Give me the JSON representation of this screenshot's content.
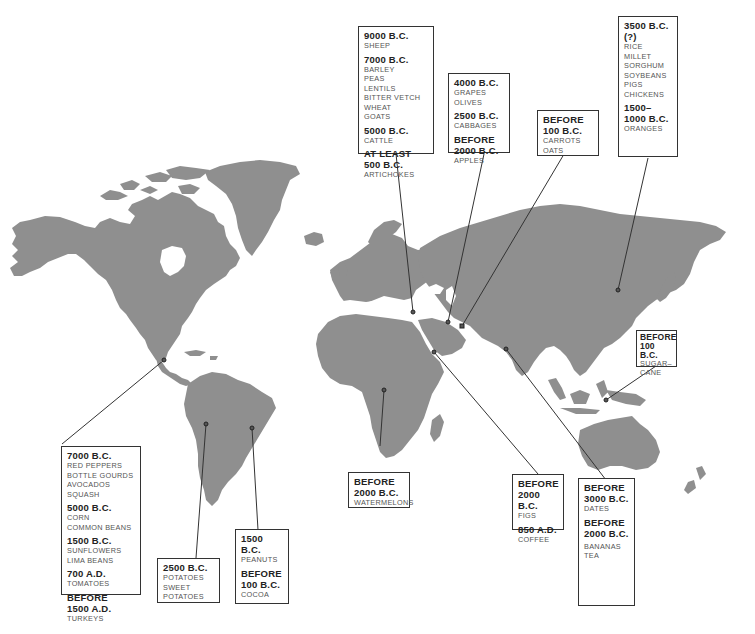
{
  "map": {
    "title": "",
    "land_color": "#8f8f8f",
    "background_color": "#ffffff",
    "callouts": [
      {
        "id": "fertile-crescent-1",
        "region": "Anatolia / Near East",
        "groups": [
          {
            "date": "9000 B.C.",
            "items": [
              "SHEEP"
            ]
          },
          {
            "date": "7000 B.C.",
            "items": [
              "BARLEY",
              "PEAS",
              "LENTILS",
              "BITTER VETCH",
              "WHEAT",
              "GOATS"
            ]
          },
          {
            "date": "5000 B.C.",
            "items": [
              "CATTLE"
            ]
          },
          {
            "date": "AT LEAST 500 B.C.",
            "date_lines": [
              "AT LEAST",
              "500 B.C."
            ],
            "items": [
              "ARTICHOKES"
            ]
          }
        ]
      },
      {
        "id": "near-east-2",
        "region": "Caucasus / Mesopotamia",
        "groups": [
          {
            "date": "4000 B.C.",
            "items": [
              "GRAPES",
              "OLIVES"
            ]
          },
          {
            "date": "2500 B.C.",
            "items": [
              "CABBAGES"
            ]
          },
          {
            "date": "BEFORE 2000 B.C.",
            "date_lines": [
              "BEFORE",
              "2000 B.C."
            ],
            "items": [
              "APPLES"
            ]
          }
        ]
      },
      {
        "id": "central-asia",
        "region": "Central Asia",
        "groups": [
          {
            "date": "BEFORE 100 B.C.",
            "date_lines": [
              "BEFORE",
              "100 B.C."
            ],
            "items": [
              "CARROTS",
              "OATS"
            ]
          }
        ]
      },
      {
        "id": "china",
        "region": "China",
        "groups": [
          {
            "date": "3500 B.C. (?)",
            "items": [
              "RICE",
              "MILLET",
              "SORGHUM",
              "SOYBEANS",
              "PIGS",
              "CHICKENS"
            ]
          },
          {
            "date": "1500–1000 B.C.",
            "date_lines": [
              "1500–",
              "1000 B.C."
            ],
            "items": [
              "ORANGES"
            ]
          }
        ]
      },
      {
        "id": "new-guinea",
        "region": "Indonesia / New Guinea",
        "groups": [
          {
            "date": "BEFORE 100 B.C.",
            "date_lines": [
              "BEFORE",
              "100 B.C."
            ],
            "items": [
              "SUGAR–",
              "CANE"
            ]
          }
        ]
      },
      {
        "id": "mesoamerica",
        "region": "Mexico / Central America",
        "groups": [
          {
            "date": "7000 B.C.",
            "items": [
              "RED PEPPERS",
              "BOTTLE GOURDS",
              "AVOCADOS",
              "SQUASH"
            ]
          },
          {
            "date": "5000 B.C.",
            "items": [
              "CORN",
              "COMMON BEANS"
            ]
          },
          {
            "date": "1500 B.C.",
            "items": [
              "SUNFLOWERS",
              "LIMA BEANS"
            ]
          },
          {
            "date": "700 A.D.",
            "items": [
              "TOMATOES"
            ]
          },
          {
            "date": "BEFORE 1500 A.D.",
            "date_lines": [
              "BEFORE",
              "1500 A.D."
            ],
            "items": [
              "TURKEYS"
            ]
          }
        ]
      },
      {
        "id": "andes",
        "region": "Andes",
        "groups": [
          {
            "date": "2500 B.C.",
            "items": [
              "POTATOES",
              "SWEET",
              "POTATOES"
            ]
          }
        ]
      },
      {
        "id": "brazil",
        "region": "Eastern South America",
        "groups": [
          {
            "date": "1500 B.C.",
            "items": [
              "PEANUTS"
            ]
          },
          {
            "date": "BEFORE 100 B.C.",
            "date_lines": [
              "BEFORE",
              "100 B.C."
            ],
            "items": [
              "COCOA"
            ]
          }
        ]
      },
      {
        "id": "africa",
        "region": "Central Africa",
        "groups": [
          {
            "date": "BEFORE 2000 B.C.",
            "date_lines": [
              "BEFORE",
              "2000 B.C."
            ],
            "items": [
              "WATERMELONS"
            ]
          }
        ]
      },
      {
        "id": "arabia",
        "region": "Arabia / Ethiopia",
        "groups": [
          {
            "date": "BEFORE 2000 B.C.",
            "date_lines": [
              "BEFORE",
              "2000 B.C."
            ],
            "items": [
              "FIGS"
            ]
          },
          {
            "date": "850 A.D.",
            "items": [
              "COFFEE"
            ]
          }
        ]
      },
      {
        "id": "india",
        "region": "India",
        "groups": [
          {
            "date": "BEFORE 3000 B.C.",
            "date_lines": [
              "BEFORE",
              "3000 B.C."
            ],
            "items": [
              "DATES"
            ]
          },
          {
            "date": "BEFORE 2000 B.C.",
            "date_lines": [
              "BEFORE",
              "2000 B.C."
            ],
            "items": [
              "BANANAS",
              "TEA"
            ]
          }
        ]
      }
    ]
  },
  "labels": {
    "c1": {
      "d1": "9000 B.C.",
      "i1": "SHEEP",
      "d2": "7000 B.C.",
      "i2a": "BARLEY",
      "i2b": "PEAS",
      "i2c": "LENTILS",
      "i2d": "BITTER VETCH",
      "i2e": "WHEAT",
      "i2f": "GOATS",
      "d3": "5000 B.C.",
      "i3": "CATTLE",
      "d4a": "AT LEAST",
      "d4b": "500 B.C.",
      "i4": "ARTICHOKES"
    },
    "c2": {
      "d1": "4000 B.C.",
      "i1a": "GRAPES",
      "i1b": "OLIVES",
      "d2": "2500 B.C.",
      "i2": "CABBAGES",
      "d3a": "BEFORE",
      "d3b": "2000 B.C.",
      "i3": "APPLES"
    },
    "c3": {
      "d1a": "BEFORE",
      "d1b": "100 B.C.",
      "i1a": "CARROTS",
      "i1b": "OATS"
    },
    "c4": {
      "d1": "3500 B.C. (?)",
      "i1a": "RICE",
      "i1b": "MILLET",
      "i1c": "SORGHUM",
      "i1d": "SOYBEANS",
      "i1e": "PIGS",
      "i1f": "CHICKENS",
      "d2a": "1500–",
      "d2b": "1000 B.C.",
      "i2": "ORANGES"
    },
    "c5": {
      "d1a": "BEFORE",
      "d1b": "100 B.C.",
      "i1a": "SUGAR–",
      "i1b": "CANE"
    },
    "c6": {
      "d1": "7000 B.C.",
      "i1a": "RED PEPPERS",
      "i1b": "BOTTLE GOURDS",
      "i1c": "AVOCADOS",
      "i1d": "SQUASH",
      "d2": "5000 B.C.",
      "i2a": "CORN",
      "i2b": "COMMON BEANS",
      "d3": "1500 B.C.",
      "i3a": "SUNFLOWERS",
      "i3b": "LIMA BEANS",
      "d4": "700 A.D.",
      "i4": "TOMATOES",
      "d5a": "BEFORE",
      "d5b": "1500 A.D.",
      "i5": "TURKEYS"
    },
    "c7": {
      "d1": "2500 B.C.",
      "i1a": "POTATOES",
      "i1b": "SWEET",
      "i1c": "POTATOES"
    },
    "c8": {
      "d1": "1500 B.C.",
      "i1": "PEANUTS",
      "d2a": "BEFORE",
      "d2b": "100 B.C.",
      "i2": "COCOA"
    },
    "c9": {
      "d1a": "BEFORE",
      "d1b": "2000 B.C.",
      "i1": "WATERMELONS"
    },
    "c10": {
      "d1a": "BEFORE",
      "d1b": "2000 B.C.",
      "i1": "FIGS",
      "d2": "850 A.D.",
      "i2": "COFFEE"
    },
    "c11": {
      "d1a": "BEFORE",
      "d1b": "3000 B.C.",
      "i1": "DATES",
      "d2a": "BEFORE",
      "d2b": "2000 B.C.",
      "i2a": "BANANAS",
      "i2b": "TEA"
    }
  }
}
